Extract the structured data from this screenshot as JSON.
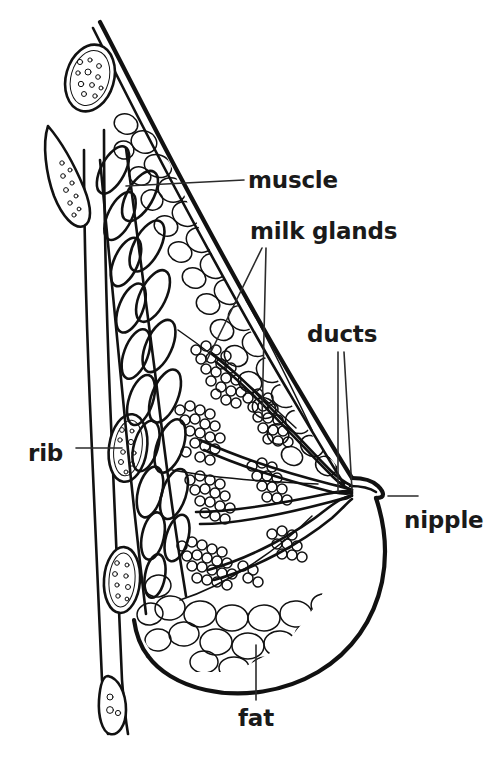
{
  "figure": {
    "kind": "line-art anatomical illustration",
    "background_color": "#ffffff",
    "ink_color": "#111111",
    "label_color": "#1a1a1a",
    "width": 502,
    "height": 762
  },
  "labels": {
    "muscle": "muscle",
    "milk_glands": "milk glands",
    "ducts": "ducts",
    "rib": "rib",
    "nipple": "nipple",
    "fat": "fat"
  },
  "structures": [
    {
      "name": "rib",
      "label": "rib",
      "description": "oval bone cross-sections with trabecular speckles along the chest wall",
      "count": 5
    },
    {
      "name": "muscle",
      "label": "muscle",
      "description": "diagonally hatched elongated pectoral muscle bundles in two columns"
    },
    {
      "name": "milk-glands",
      "label": "milk glands",
      "description": "dense grape-like lobules of small circles, the glandular tissue"
    },
    {
      "name": "ducts",
      "label": "ducts",
      "description": "long tapering tubes converging toward the nipple"
    },
    {
      "name": "nipple",
      "label": "nipple",
      "description": "protruding tip at the right where ducts exit"
    },
    {
      "name": "fat",
      "label": "fat",
      "description": "large rounded adipose lobules filling the lower and outer breast"
    }
  ],
  "label_placement": [
    {
      "key": "muscle",
      "text_x": 248,
      "text_y": 188,
      "anchor": "start"
    },
    {
      "key": "milk_glands",
      "text_x": 250,
      "text_y": 239,
      "anchor": "start"
    },
    {
      "key": "ducts",
      "text_x": 307,
      "text_y": 342,
      "anchor": "start"
    },
    {
      "key": "rib",
      "text_x": 28,
      "text_y": 461,
      "anchor": "start"
    },
    {
      "key": "nipple",
      "text_x": 404,
      "text_y": 528,
      "anchor": "start"
    },
    {
      "key": "fat",
      "text_x": 238,
      "text_y": 726,
      "anchor": "start"
    }
  ]
}
